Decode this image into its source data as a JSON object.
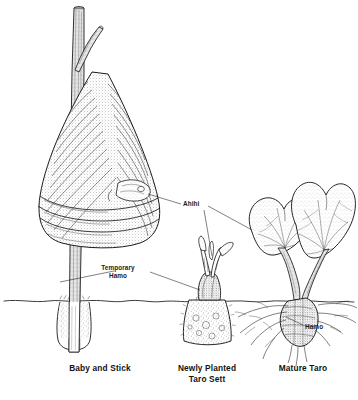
{
  "figure": {
    "background_color": "#ffffff",
    "ink_color": "#1a1a1a",
    "width": 358,
    "height": 400
  },
  "callouts": {
    "ahihi": {
      "text": "Ahihi",
      "x": 183,
      "y": 200
    },
    "temporary_hamo": {
      "line1": "Temporary",
      "line2": "Hamo",
      "x": 118,
      "y": 268
    },
    "hamo": {
      "text": "Hamo",
      "x": 305,
      "y": 327
    }
  },
  "captions": [
    {
      "id": "baby-and-stick",
      "line1": "Baby and Stick",
      "line2": "",
      "x": 100,
      "y": 365
    },
    {
      "id": "newly-planted-taro-sett",
      "line1": "Newly Planted",
      "line2": "Taro Sett",
      "x": 207,
      "y": 365
    },
    {
      "id": "mature-taro",
      "line1": "Mature Taro",
      "line2": "",
      "x": 303,
      "y": 365
    }
  ],
  "ground_line": {
    "label": "soil surface",
    "y": 300
  },
  "specimens": [
    {
      "id": "baby-and-stick",
      "name": "Baby and Stick"
    },
    {
      "id": "newly-planted-taro-sett",
      "name": "Newly Planted Taro Sett"
    },
    {
      "id": "mature-taro",
      "name": "Mature Taro"
    }
  ]
}
